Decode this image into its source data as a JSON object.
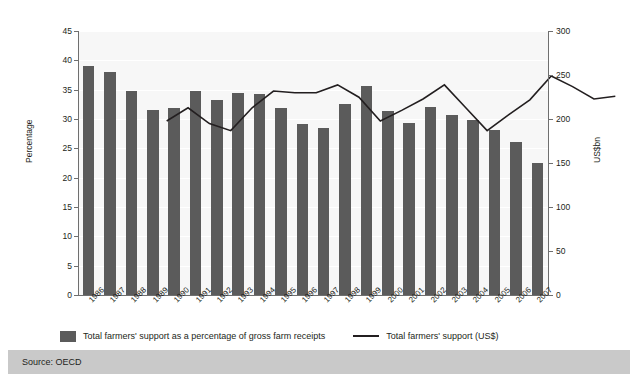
{
  "figure": {
    "left_axis_title": "Percentage",
    "right_axis_title": "US$bn",
    "source": "Source: OECD"
  },
  "legend": {
    "bar_label": "Total farmers' support as a percentage of gross farm receipts",
    "line_label": "Total farmers' support (US$)"
  },
  "chart_data": {
    "type": "bar",
    "title": "",
    "xlabel": "",
    "ylabel": "Percentage",
    "y2label": "US$bn",
    "ylim": [
      0,
      45
    ],
    "y2lim": [
      0,
      300
    ],
    "y_ticks": [
      0,
      5,
      10,
      15,
      20,
      25,
      30,
      35,
      40,
      45
    ],
    "y2_ticks": [
      0,
      50,
      100,
      150,
      200,
      250,
      300
    ],
    "grid": true,
    "legend_position": "bottom",
    "categories": [
      "1986",
      "1987",
      "1988",
      "1989",
      "1990",
      "1991",
      "1992",
      "1993",
      "1994",
      "1995",
      "1996",
      "1997",
      "1998",
      "1999",
      "2000",
      "2001",
      "2002",
      "2003",
      "2004",
      "2005",
      "2006",
      "2007"
    ],
    "series": [
      {
        "name": "Total farmers' support as a percentage of gross farm receipts",
        "type": "bar",
        "axis": "left",
        "unit": "%",
        "color": "#5b5b5b",
        "values": [
          39.1,
          38.0,
          34.7,
          31.6,
          31.8,
          34.8,
          33.2,
          34.4,
          34.3,
          31.8,
          29.1,
          28.5,
          32.5,
          35.6,
          31.3,
          29.3,
          32.0,
          30.6,
          29.8,
          28.1,
          26.1,
          22.5
        ]
      },
      {
        "name": "Total farmers' support (US$)",
        "type": "line",
        "axis": "right",
        "unit": "US$bn",
        "color": "#231f20",
        "values": [
          233,
          248,
          230,
          222,
          248,
          267,
          265,
          265,
          274,
          260,
          233,
          245,
          258,
          274,
          248,
          222,
          240,
          257,
          284,
          272,
          258,
          261
        ]
      }
    ]
  }
}
